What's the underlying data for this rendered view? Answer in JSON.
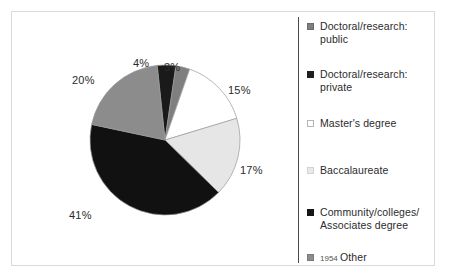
{
  "chart_data": {
    "type": "pie",
    "title": "",
    "subtitle": "",
    "xlabel": "",
    "ylabel": "",
    "legend_position": "right",
    "grid": false,
    "categories": [
      "Doctoral/research: public",
      "Doctoral/research: private",
      "Master's degree",
      "Baccalaureate",
      "Community/colleges/ Associates degree",
      "Other"
    ],
    "values": [
      3,
      4,
      15,
      17,
      41,
      20
    ],
    "value_labels": [
      "3%",
      "4%",
      "15%",
      "17%",
      "41%",
      "20%"
    ],
    "colors": [
      "#7f7f7f",
      "#1a1a1a",
      "#ffffff",
      "#e6e6e6",
      "#111111",
      "#8c8c8c"
    ],
    "slice_order_clockwise_from_top": [
      "Doctoral/research: private",
      "Doctoral/research: public",
      "Master's degree",
      "Baccalaureate",
      "Community/colleges/ Associates degree",
      "Other"
    ],
    "units": "percent",
    "total": 100
  },
  "plot": {
    "percent_labels": [
      {
        "text": "4%",
        "x": 121,
        "y": 45
      },
      {
        "text": "3%",
        "x": 152,
        "y": 49
      },
      {
        "text": "20%",
        "x": 60,
        "y": 62
      },
      {
        "text": "15%",
        "x": 216,
        "y": 72
      },
      {
        "text": "17%",
        "x": 228,
        "y": 152
      },
      {
        "text": "41%",
        "x": 57,
        "y": 197
      }
    ]
  },
  "legend": {
    "items": [
      {
        "label": "Doctoral/research:\npublic",
        "swatch_color": "#7f7f7f",
        "swatch_border": "#6b6b6b",
        "top": 0
      },
      {
        "label": "Doctoral/research:\nprivate",
        "swatch_color": "#1f1f1f",
        "swatch_border": "#1f1f1f",
        "top": 48
      },
      {
        "label": "Master's degree",
        "swatch_color": "#ffffff",
        "swatch_border": "#b5b5b5",
        "top": 97
      },
      {
        "label": "Baccalaureate",
        "swatch_color": "#e9e9e9",
        "swatch_border": "#d2d2d2",
        "top": 144
      },
      {
        "label": "Community/colleges/\nAssociates degree",
        "swatch_color": "#161616",
        "swatch_border": "#161616",
        "top": 186
      },
      {
        "label": "Other",
        "swatch_color": "#8c8c8c",
        "swatch_border": "#7a7a7a",
        "top": 231,
        "prefix": "1954"
      }
    ]
  },
  "style": {
    "background": "#ffffff",
    "frame_color": "#d9d9d9",
    "divider_color": "#4a4a4a",
    "text_color": "#2b2b2b"
  }
}
